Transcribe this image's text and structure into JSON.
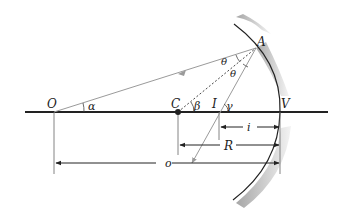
{
  "diagram": {
    "points": {
      "O": {
        "label": "O",
        "x": 54,
        "y": 112
      },
      "C": {
        "label": "C",
        "x": 178,
        "y": 112
      },
      "I": {
        "label": "I",
        "x": 219,
        "y": 112
      },
      "V": {
        "label": "V",
        "x": 280,
        "y": 112
      },
      "A": {
        "label": "A",
        "x": 256,
        "y": 48
      }
    },
    "angles": {
      "alpha": "α",
      "beta": "β",
      "gamma": "γ",
      "theta_incident": "θ",
      "theta_reflected": "θ"
    },
    "distances": {
      "i": "i",
      "R": "R",
      "o": "o"
    },
    "colors": {
      "axis": "#222222",
      "ray": "#9a9a9a",
      "mirror_shade": "#b0b0b0",
      "text": "#222222"
    }
  }
}
